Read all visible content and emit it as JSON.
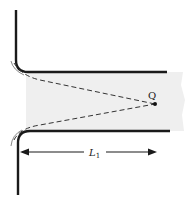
{
  "diagram": {
    "point_label": "Q",
    "length_label": "L",
    "length_subscript": "1",
    "colors": {
      "wall": "#1a1a1a",
      "shading": "#efefef",
      "dashed": "#333333"
    }
  }
}
